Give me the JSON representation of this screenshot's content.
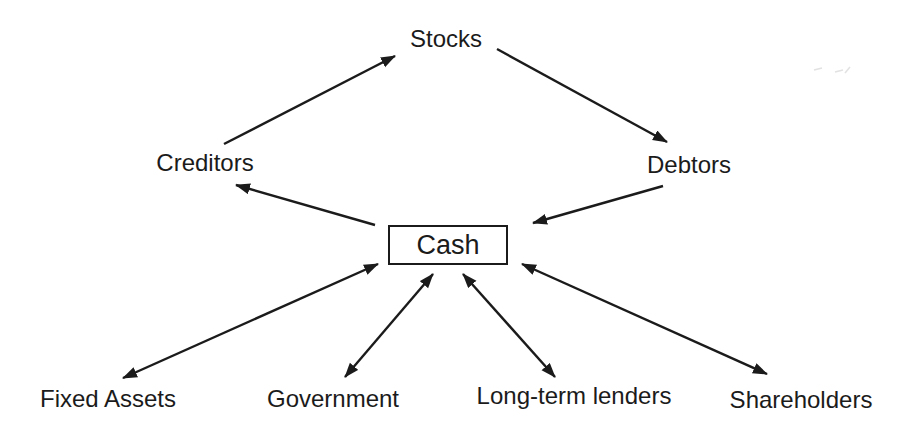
{
  "diagram": {
    "nodes": {
      "stocks": {
        "label": "Stocks"
      },
      "creditors": {
        "label": "Creditors"
      },
      "debtors": {
        "label": "Debtors"
      },
      "cash": {
        "label": "Cash"
      },
      "fixed_assets": {
        "label": "Fixed Assets"
      },
      "government": {
        "label": "Government"
      },
      "long_term_lenders": {
        "label": "Long-term lenders"
      },
      "shareholders": {
        "label": "Shareholders"
      }
    },
    "edges": [
      {
        "from": "creditors",
        "to": "stocks",
        "direction": "one-way"
      },
      {
        "from": "stocks",
        "to": "debtors",
        "direction": "one-way"
      },
      {
        "from": "debtors",
        "to": "cash",
        "direction": "one-way"
      },
      {
        "from": "cash",
        "to": "creditors",
        "direction": "one-way"
      },
      {
        "from": "cash",
        "to": "fixed_assets",
        "direction": "two-way"
      },
      {
        "from": "cash",
        "to": "government",
        "direction": "two-way"
      },
      {
        "from": "cash",
        "to": "long_term_lenders",
        "direction": "two-way"
      },
      {
        "from": "cash",
        "to": "shareholders",
        "direction": "two-way"
      }
    ]
  },
  "colors": {
    "ink": "#1b1b1b",
    "background": "#ffffff"
  }
}
